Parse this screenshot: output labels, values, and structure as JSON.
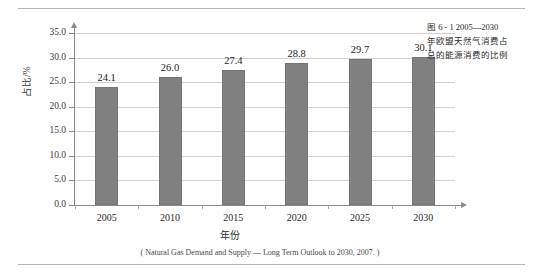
{
  "caption": {
    "lines": [
      "图 6 - 1   2005—2030",
      "年欧盟天然气消费占",
      "总的能源消费的比例"
    ]
  },
  "source_note": "( Natural Gas Demand and Supply — Long Term Outlook to 2030, 2007. )",
  "colors": {
    "bar_fill": "#808080",
    "bar_stroke": "#757575",
    "gridline": "#d2d2d2",
    "axis": "#8a8a8a",
    "rule": "#b4b4b4"
  },
  "chart_data": {
    "type": "bar",
    "title": "",
    "subtitle": "",
    "categories": [
      "2005",
      "2010",
      "2015",
      "2020",
      "2025",
      "2030"
    ],
    "values": [
      24.1,
      26.0,
      27.4,
      28.8,
      29.7,
      30.1
    ],
    "value_labels": [
      "24.1",
      "26.0",
      "27.4",
      "28.8",
      "29.7",
      "30.1"
    ],
    "xlabel": "年份",
    "ylabel": "占比/%",
    "ylim": [
      0.0,
      35.0
    ],
    "ytick_labels": [
      "35.0",
      "30.0",
      "25.0",
      "20.0",
      "15.0",
      "10.0",
      "5.0",
      "0.0"
    ],
    "ytick_values": [
      35.0,
      30.0,
      25.0,
      20.0,
      15.0,
      10.0,
      5.0,
      0.0
    ],
    "grid": true,
    "legend": "none",
    "series": [
      {
        "name": "天然气消费占比",
        "values": [
          24.1,
          26.0,
          27.4,
          28.8,
          29.7,
          30.1
        ]
      }
    ]
  }
}
